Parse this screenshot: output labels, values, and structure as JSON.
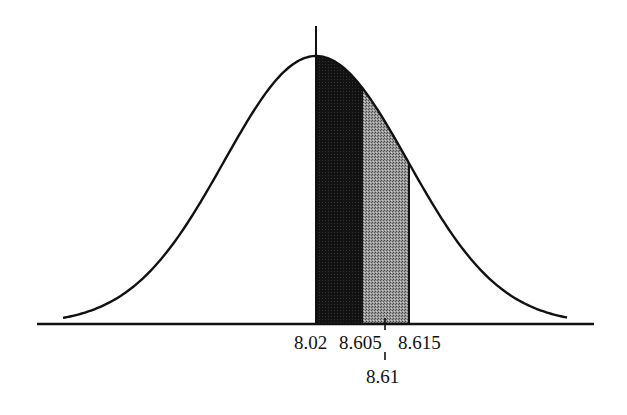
{
  "chart_data": {
    "type": "area",
    "title": "",
    "xlabel": "",
    "ylabel": "",
    "grid": false,
    "legend": null,
    "mean_label": "8.02",
    "tick_labels": [
      "8.02",
      "8.605",
      "8.615"
    ],
    "sub_tick_label": "8.61",
    "regions": [
      {
        "name": "dark",
        "from": "8.02",
        "to": "8.605",
        "color": "#141414"
      },
      {
        "name": "gray",
        "from": "8.605",
        "to": "8.615",
        "color": "#8a8a8a"
      }
    ]
  },
  "labels": {
    "mean": "8.02",
    "lower": "8.605",
    "upper": "8.615",
    "middle": "8.61"
  }
}
